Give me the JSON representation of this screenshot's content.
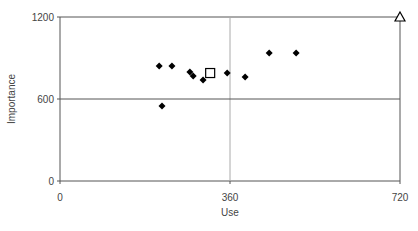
{
  "chart_data": {
    "type": "scatter",
    "title": "",
    "xlabel": "Use",
    "ylabel": "Importance",
    "xlim": [
      0,
      720
    ],
    "ylim": [
      0,
      1200
    ],
    "xticks": [
      0,
      360,
      720
    ],
    "yticks": [
      0,
      600,
      1200
    ],
    "grid": false,
    "reference_lines": {
      "x": 360,
      "y": 600
    },
    "legend": null,
    "series": [
      {
        "name": "items",
        "marker": "diamond",
        "color": "#000000",
        "points": [
          {
            "x": 210,
            "y": 841
          },
          {
            "x": 237,
            "y": 841
          },
          {
            "x": 275,
            "y": 797
          },
          {
            "x": 282,
            "y": 768
          },
          {
            "x": 303,
            "y": 739
          },
          {
            "x": 354,
            "y": 790
          },
          {
            "x": 392,
            "y": 761
          },
          {
            "x": 443,
            "y": 936
          },
          {
            "x": 500,
            "y": 936
          },
          {
            "x": 216,
            "y": 549
          }
        ]
      },
      {
        "name": "mean",
        "marker": "square-open",
        "color": "#000000",
        "points": [
          {
            "x": 318,
            "y": 790
          }
        ]
      },
      {
        "name": "max",
        "marker": "triangle-open",
        "color": "#000000",
        "points": [
          {
            "x": 720,
            "y": 1200
          }
        ]
      }
    ]
  },
  "labels": {
    "x_axis": "Use",
    "y_axis": "Importance",
    "x_ticks": [
      "0",
      "360",
      "720"
    ],
    "y_ticks": [
      "0",
      "600",
      "1200"
    ]
  }
}
